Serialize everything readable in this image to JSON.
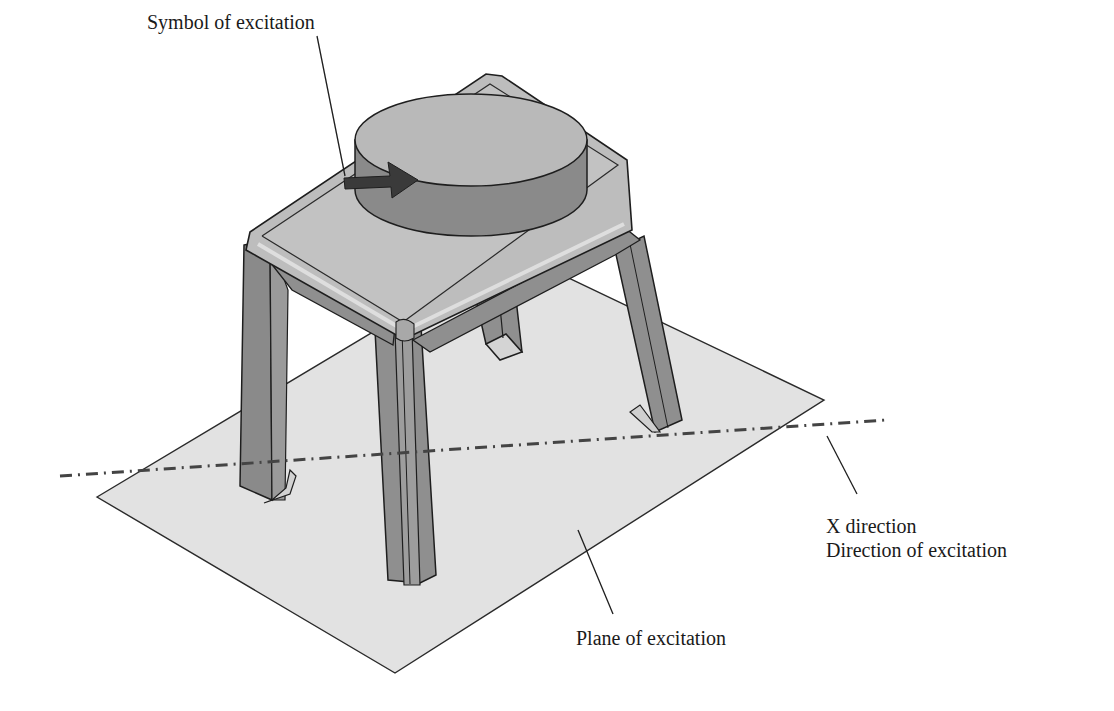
{
  "figure": {
    "type": "technical-illustration"
  },
  "labels": {
    "symbol": "Symbol of excitation",
    "x_direction_line1": "X direction",
    "x_direction_line2": "Direction of excitation",
    "plane": "Plane of excitation"
  },
  "colors": {
    "background": "#ffffff",
    "plane_fill": "#e2e2e2",
    "frame_top": "#bdbdbd",
    "frame_side": "#8f8f8f",
    "frame_dark": "#7a7a7a",
    "cylinder_top": "#b9b9b9",
    "cylinder_side": "#8a8a8a",
    "arrow": "#3a3a3a",
    "outline": "#1e1e1e",
    "axis_line": "#444444"
  }
}
